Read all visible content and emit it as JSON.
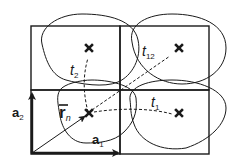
{
  "diagram": {
    "title": "",
    "colors": {
      "stroke": "#1a1a1a",
      "background": "#ffffff"
    },
    "grid": {
      "rows": 2,
      "cols": 2,
      "cell_stroke_width": 1.4
    },
    "sites": [
      {
        "id": "origin",
        "label": "",
        "marker": "x-icon"
      },
      {
        "id": "up",
        "label": "",
        "marker": "x-icon"
      },
      {
        "id": "right",
        "label": "",
        "marker": "x-icon"
      },
      {
        "id": "diag",
        "label": "",
        "marker": "x-icon"
      }
    ],
    "hoppings": [
      {
        "label": "t",
        "subscript": "1",
        "from": "origin",
        "to": "right",
        "style": "dashed"
      },
      {
        "label": "t",
        "subscript": "2",
        "from": "origin",
        "to": "up",
        "style": "dashed"
      },
      {
        "label": "t",
        "subscript": "12",
        "from": "origin",
        "to": "diag",
        "style": "dashed"
      }
    ],
    "vectors": [
      {
        "label": "a",
        "subscript": "1",
        "direction": "horizontal"
      },
      {
        "label": "a",
        "subscript": "2",
        "direction": "vertical"
      },
      {
        "label": "r",
        "subscript": "n",
        "overbar": true,
        "direction": "diagonal"
      }
    ],
    "orbitals": {
      "count": 4,
      "shape": "closed-curve"
    }
  },
  "labels": {
    "t1": "t",
    "t1_sub": "1",
    "t2": "t",
    "t2_sub": "2",
    "t12": "t",
    "t12_sub": "12",
    "a1": "a",
    "a1_sub": "1",
    "a2": "a",
    "a2_sub": "2",
    "rn": "r",
    "rn_sub": "n"
  }
}
